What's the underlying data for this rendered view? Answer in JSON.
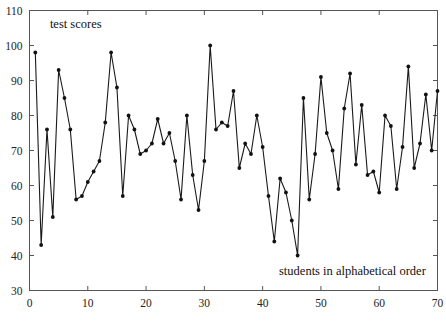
{
  "chart_data": {
    "type": "line",
    "title": "",
    "subtitle": "",
    "xlabel": "students in alphabetical order",
    "ylabel": "test scores",
    "xlim": [
      0,
      70
    ],
    "ylim": [
      30,
      110
    ],
    "xticks": [
      0,
      10,
      20,
      30,
      40,
      50,
      60,
      70
    ],
    "ytick_labels": [
      "30",
      "40",
      "50",
      "60",
      "70",
      "80",
      "90",
      "100",
      "110"
    ],
    "yticks": [
      30,
      40,
      50,
      60,
      70,
      80,
      90,
      100,
      110
    ],
    "grid": false,
    "legend": null,
    "legend_position": "none",
    "marker": "filled-circle",
    "line_color": "#1a1a1a",
    "marker_color": "#111111",
    "annotations": [
      {
        "text": "test scores",
        "x": 3.5,
        "y": 105,
        "anchor": "start"
      },
      {
        "text": "students in alphabetical order",
        "x": 68,
        "y": 34.5,
        "anchor": "end"
      }
    ],
    "x": [
      1,
      2,
      3,
      4,
      5,
      6,
      7,
      8,
      9,
      10,
      11,
      12,
      13,
      14,
      15,
      16,
      17,
      18,
      19,
      20,
      21,
      22,
      23,
      24,
      25,
      26,
      27,
      28,
      29,
      30,
      31,
      32,
      33,
      34,
      35,
      36,
      37,
      38,
      39,
      40,
      41,
      42,
      43,
      44,
      45,
      46,
      47,
      48,
      49,
      50,
      51,
      52,
      53,
      54,
      55,
      56,
      57,
      58,
      59,
      60,
      61,
      62,
      63,
      64,
      65,
      66,
      67,
      68,
      69,
      70
    ],
    "values": [
      98,
      43,
      76,
      51,
      93,
      85,
      76,
      56,
      57,
      61,
      64,
      67,
      78,
      98,
      88,
      57,
      80,
      76,
      69,
      70,
      72,
      79,
      72,
      75,
      67,
      56,
      80,
      63,
      53,
      67,
      100,
      76,
      78,
      77,
      87,
      65,
      72,
      69,
      80,
      71,
      57,
      44,
      62,
      58,
      50,
      40,
      85,
      56,
      69,
      91,
      75,
      70,
      59,
      82,
      92,
      66,
      83,
      63,
      64,
      58,
      80,
      77,
      59,
      71,
      94,
      65,
      72,
      86,
      70,
      87
    ]
  }
}
